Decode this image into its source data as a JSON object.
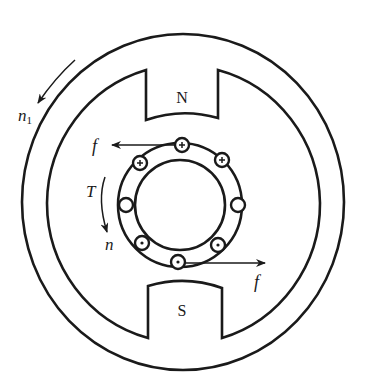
{
  "diagram": {
    "type": "dc-motor-cross-section",
    "stator": {
      "north_pole_label": "N",
      "south_pole_label": "S"
    },
    "rotor": {
      "conductors": [
        {
          "position": "top",
          "symbol": "cross"
        },
        {
          "position": "top-left",
          "symbol": "cross"
        },
        {
          "position": "top-right",
          "symbol": "cross"
        },
        {
          "position": "left",
          "symbol": "empty"
        },
        {
          "position": "right",
          "symbol": "empty"
        },
        {
          "position": "bottom-left",
          "symbol": "dot"
        },
        {
          "position": "bottom-right",
          "symbol": "dot"
        },
        {
          "position": "bottom",
          "symbol": "dot"
        }
      ]
    },
    "labels": {
      "field_speed": "n",
      "field_speed_subscript": "1",
      "force_top": "f",
      "force_bottom": "f",
      "torque": "T",
      "rotor_speed": "n"
    },
    "colors": {
      "line": "#1a1a1a",
      "background": "#ffffff"
    }
  }
}
